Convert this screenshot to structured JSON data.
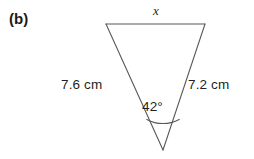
{
  "figure": {
    "part_label": "(b)",
    "background_color": "#ffffff",
    "stroke_color": "#58595b",
    "text_color": "#231f20",
    "width": 254,
    "height": 159,
    "shape": "triangle",
    "orientation": "inverted",
    "vertices": {
      "top_left": {
        "x": 106,
        "y": 24
      },
      "top_right": {
        "x": 205,
        "y": 24
      },
      "apex_bottom": {
        "x": 163,
        "y": 150
      }
    },
    "labels": {
      "unknown_side": "x",
      "left_side": "7.6 cm",
      "right_side": "7.2 cm",
      "included_angle": "42°"
    },
    "angle_arc": {
      "center": {
        "x": 163,
        "y": 150
      },
      "radius": 36,
      "start": {
        "x": 140,
        "y": 122
      },
      "end": {
        "x": 186,
        "y": 122
      }
    }
  }
}
